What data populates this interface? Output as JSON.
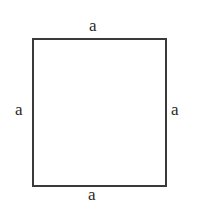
{
  "diagram": {
    "shape": "square",
    "stroke_color": "#3a3a3a",
    "labels": {
      "top": "a",
      "bottom": "a",
      "left": "a",
      "right": "a"
    }
  }
}
